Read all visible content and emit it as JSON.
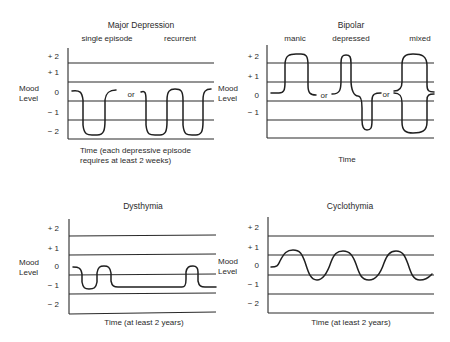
{
  "panels": [
    {
      "id": "major-depression",
      "title": "Major Depression",
      "subtitles": [
        "single episode",
        "recurrent"
      ],
      "ylabel": [
        "Mood",
        "Level"
      ],
      "yticks": [
        "+ 2",
        "+ 1",
        "0",
        "− 1",
        "− 2"
      ],
      "xlabel": [
        "Time (each depressive episode",
        "requires at least 2 weeks)"
      ],
      "separators": [
        "or"
      ]
    },
    {
      "id": "bipolar",
      "title": "Bipolar",
      "subtitles": [
        "manic",
        "depressed",
        "mixed"
      ],
      "ylabel": [
        "Mood",
        "Level"
      ],
      "yticks": [
        "+ 2",
        "+ 1",
        "0",
        "− 1"
      ],
      "xlabel": [
        "Time"
      ],
      "separators": [
        "or",
        "or"
      ]
    },
    {
      "id": "dysthymia",
      "title": "Dysthymia",
      "subtitles": [],
      "ylabel": [
        "Mood",
        "Level"
      ],
      "yticks": [
        "+ 2",
        "+ 1",
        "0",
        "− 1",
        "− 2"
      ],
      "xlabel": [
        "Time (at least 2 years)"
      ],
      "separators": []
    },
    {
      "id": "cyclothymia",
      "title": "Cyclothymia",
      "subtitles": [],
      "ylabel": [
        "Mood",
        "Level"
      ],
      "yticks": [
        "+ 2",
        "+ 1",
        "0",
        "− 1",
        "− 2"
      ],
      "xlabel": [
        "Time (at least 2 years)"
      ],
      "separators": []
    }
  ]
}
